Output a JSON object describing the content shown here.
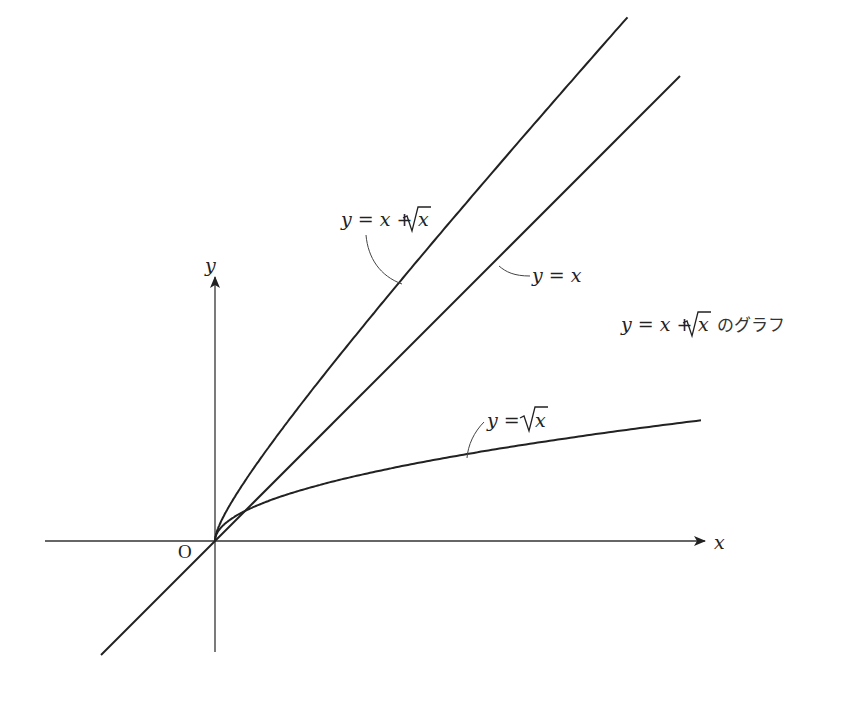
{
  "axes": {
    "x_label": "x",
    "y_label": "y",
    "origin_label": "O"
  },
  "curves": [
    {
      "id": "sum",
      "label_lhs": "y = x + ",
      "label_rad": "x",
      "equation": "y = x + √x"
    },
    {
      "id": "linear",
      "label_lhs": "y = x",
      "equation": "y = x"
    },
    {
      "id": "sqrt",
      "label_lhs": "y = ",
      "label_rad": "x",
      "equation": "y = √x"
    }
  ],
  "caption": {
    "lhs": "y = x + ",
    "rad": "x",
    "suffix": " のグラフ"
  },
  "colors": {
    "curve": "#222222",
    "axis": "#333333",
    "background": "#ffffff"
  },
  "chart_data": {
    "type": "line",
    "xlabel": "x",
    "ylabel": "y",
    "grid": false,
    "series": [
      {
        "name": "y = x + √x",
        "x": [
          0,
          0.25,
          1,
          4,
          9,
          13.7
        ],
        "values": [
          0,
          0.75,
          2,
          6,
          12,
          17.4
        ]
      },
      {
        "name": "y = x",
        "x": [
          -3.8,
          0,
          16
        ],
        "values": [
          -3.8,
          0,
          16
        ]
      },
      {
        "name": "y = √x",
        "x": [
          0,
          1,
          4,
          9,
          16.2
        ],
        "values": [
          0,
          1,
          2,
          3,
          4.02
        ]
      }
    ],
    "annotations": [
      "O",
      "y = x + √x",
      "y = x",
      "y = √x",
      "y = x + √x のグラフ"
    ]
  }
}
